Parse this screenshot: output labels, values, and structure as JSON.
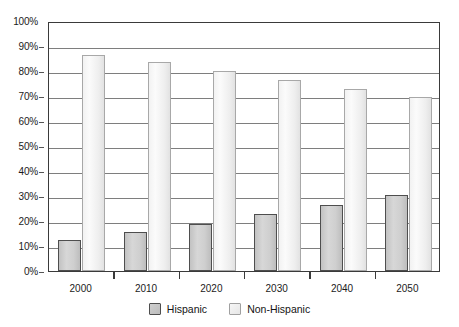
{
  "chart_data": {
    "type": "bar",
    "title": "",
    "subtitle": "",
    "xlabel": "",
    "ylabel": "",
    "categories": [
      "2000",
      "2010",
      "2020",
      "2030",
      "2040",
      "2050"
    ],
    "series": [
      {
        "name": "Hispanic",
        "values": [
          12.5,
          15.5,
          19,
          23,
          26.5,
          30.5
        ],
        "color": "#cfcfcf"
      },
      {
        "name": "Non-Hispanic",
        "values": [
          86.5,
          83.5,
          80,
          76.5,
          73,
          69.5
        ],
        "color": "#f0f0f0"
      }
    ],
    "ylim": [
      0,
      100
    ],
    "ytick_labels": [
      "0%",
      "10%",
      "20%",
      "30%",
      "40%",
      "50%",
      "60%",
      "70%",
      "80%",
      "90%",
      "100%"
    ],
    "ytick_values": [
      0,
      10,
      20,
      30,
      40,
      50,
      60,
      70,
      80,
      90,
      100
    ],
    "grid": true,
    "legend_position": "bottom",
    "annotations": []
  },
  "legend": {
    "entries": [
      {
        "label": "Hispanic"
      },
      {
        "label": "Non-Hispanic"
      }
    ]
  }
}
